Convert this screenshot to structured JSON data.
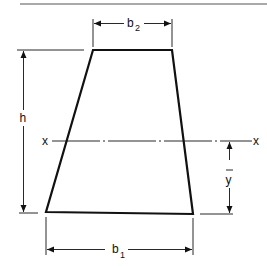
{
  "figure": {
    "shape": "trapezoid",
    "labels": {
      "top_width": "b",
      "top_width_sub": "2",
      "bottom_width": "b",
      "bottom_width_sub": "1",
      "height": "h",
      "axis_left": "x",
      "axis_right": "x",
      "centroid_distance": "y"
    },
    "colors": {
      "line": "#111111",
      "background": "#ffffff"
    }
  }
}
